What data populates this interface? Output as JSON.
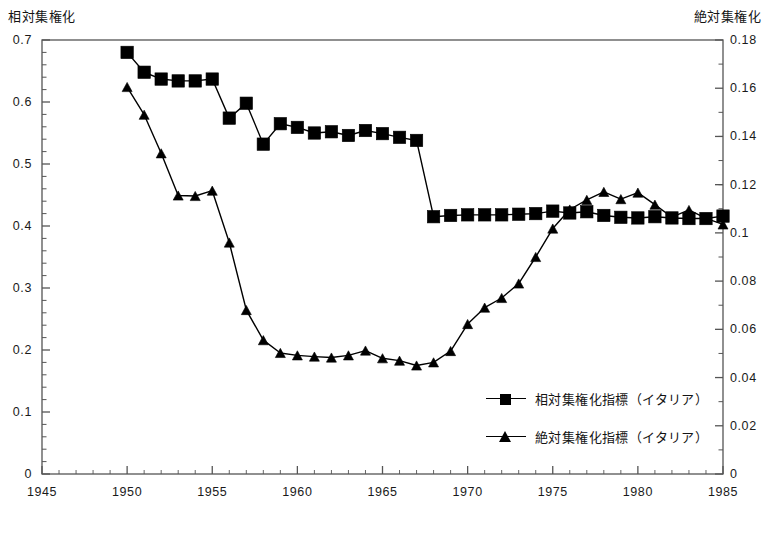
{
  "axis_titles": {
    "left": "相対集権化",
    "right": "絶対集権化"
  },
  "legend": {
    "relative_label": "相対集権化指標（イタリア）",
    "absolute_label": "絶対集権化指標（イタリア）",
    "relative_marker": "square-marker-icon",
    "absolute_marker": "triangle-marker-icon"
  },
  "colors": {
    "series": "#000000",
    "axis": "#555555",
    "background": "#ffffff"
  },
  "chart_data": {
    "type": "line",
    "title": "",
    "subtitle": "",
    "xlabel": "",
    "ylabel": "相対集権化",
    "y2label": "絶対集権化",
    "grid": false,
    "legend_position": "inside-lower-right",
    "xlim": [
      1945,
      1985
    ],
    "xticks": [
      1945,
      1950,
      1955,
      1960,
      1965,
      1970,
      1975,
      1980,
      1985
    ],
    "xtick_labels": [
      "1945",
      "1950",
      "1955",
      "1960",
      "1965",
      "1970",
      "1975",
      "1980",
      "1985"
    ],
    "ylim": [
      0,
      0.7
    ],
    "yticks": [
      0,
      0.1,
      0.2,
      0.3,
      0.4,
      0.5,
      0.6,
      0.7
    ],
    "ytick_labels": [
      "0",
      "0.1",
      "0.2",
      "0.3",
      "0.4",
      "0.5",
      "0.6",
      "0.7"
    ],
    "y2lim": [
      0,
      0.18
    ],
    "y2ticks": [
      0,
      0.02,
      0.04,
      0.06,
      0.08,
      0.1,
      0.12,
      0.14,
      0.16,
      0.18
    ],
    "y2tick_labels": [
      "0",
      "0.02",
      "0.04",
      "0.06",
      "0.08",
      "0.1",
      "0.12",
      "0.14",
      "0.16",
      "0.18"
    ],
    "x": [
      1950,
      1951,
      1952,
      1953,
      1954,
      1955,
      1956,
      1957,
      1958,
      1959,
      1960,
      1961,
      1962,
      1963,
      1964,
      1965,
      1966,
      1967,
      1968,
      1969,
      1970,
      1971,
      1972,
      1973,
      1974,
      1975,
      1976,
      1977,
      1978,
      1979,
      1980,
      1981,
      1982,
      1983,
      1984,
      1985
    ],
    "series": [
      {
        "name": "相対集権化指標（イタリア）",
        "axis": "left",
        "marker": "square",
        "values": [
          0.68,
          0.648,
          0.637,
          0.634,
          0.634,
          0.637,
          0.574,
          0.598,
          0.532,
          0.565,
          0.559,
          0.55,
          0.552,
          0.546,
          0.554,
          0.549,
          0.543,
          0.538,
          0.415,
          0.417,
          0.418,
          0.418,
          0.418,
          0.419,
          0.42,
          0.424,
          0.421,
          0.423,
          0.417,
          0.414,
          0.413,
          0.415,
          0.413,
          0.412,
          0.412,
          0.416
        ]
      },
      {
        "name": "絶対集権化指標（イタリア）",
        "axis": "right",
        "marker": "triangle",
        "values": [
          0.1605,
          0.149,
          0.133,
          0.1155,
          0.1153,
          0.1175,
          0.096,
          0.068,
          0.0555,
          0.0502,
          0.0492,
          0.0487,
          0.0483,
          0.0492,
          0.0512,
          0.048,
          0.047,
          0.045,
          0.0463,
          0.051,
          0.0622,
          0.069,
          0.073,
          0.079,
          0.09,
          0.1018,
          0.1097,
          0.1137,
          0.117,
          0.114,
          0.1167,
          0.1117,
          0.1065,
          0.1095,
          0.106,
          0.1035
        ]
      }
    ]
  }
}
